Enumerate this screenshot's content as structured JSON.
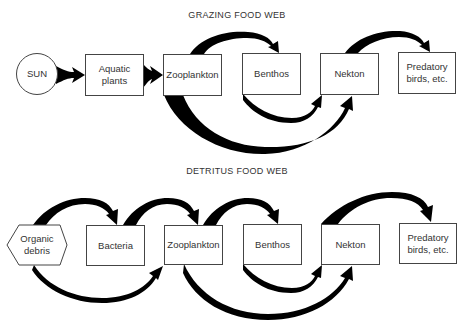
{
  "colors": {
    "arrow": "#000000",
    "box_border": "#444444",
    "text": "#333333",
    "background": "#ffffff"
  },
  "grazing": {
    "title": "GRAZING FOOD WEB",
    "nodes": {
      "sun": "SUN",
      "aquatic_plants": "Aquatic\nplants",
      "zooplankton": "Zooplankton",
      "benthos": "Benthos",
      "nekton": "Nekton",
      "predatory_birds": "Predatory\nbirds, etc."
    },
    "flows": [
      {
        "from": "SUN",
        "to": "Aquatic plants"
      },
      {
        "from": "Aquatic plants",
        "to": "Zooplankton"
      },
      {
        "from": "Zooplankton",
        "to": "Benthos"
      },
      {
        "from": "Zooplankton",
        "to": "Nekton"
      },
      {
        "from": "Benthos",
        "to": "Nekton"
      },
      {
        "from": "Nekton",
        "to": "Predatory birds, etc."
      }
    ]
  },
  "detritus": {
    "title": "DETRITUS FOOD WEB",
    "nodes": {
      "organic_debris": "Organic\ndebris",
      "bacteria": "Bacteria",
      "zooplankton": "Zooplankton",
      "benthos": "Benthos",
      "nekton": "Nekton",
      "predatory_birds": "Predatory\nbirds, etc."
    },
    "flows": [
      {
        "from": "Organic debris",
        "to": "Bacteria"
      },
      {
        "from": "Organic debris",
        "to": "Zooplankton"
      },
      {
        "from": "Bacteria",
        "to": "Zooplankton"
      },
      {
        "from": "Zooplankton",
        "to": "Benthos"
      },
      {
        "from": "Zooplankton",
        "to": "Nekton"
      },
      {
        "from": "Benthos",
        "to": "Nekton"
      },
      {
        "from": "Nekton",
        "to": "Predatory birds, etc."
      }
    ]
  }
}
